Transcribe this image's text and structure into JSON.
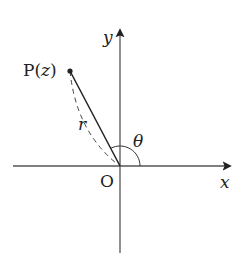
{
  "diagram": {
    "type": "complex-plane-polar-form",
    "labels": {
      "point": "P(z)",
      "point_letter": "P",
      "point_arg": "z",
      "origin": "O",
      "x_axis": "x",
      "y_axis": "y",
      "radius": "r",
      "angle": "θ"
    },
    "colors": {
      "ink": "#222222",
      "axis": "#555555"
    },
    "geometry": {
      "origin_px": [
        120,
        166
      ],
      "point_px": [
        70,
        71
      ],
      "x_axis_px": [
        13,
        232
      ],
      "y_axis_px": [
        253,
        30
      ]
    }
  }
}
